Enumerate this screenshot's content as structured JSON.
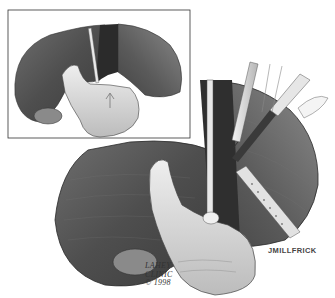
{
  "illustration": {
    "subject": "surgical illustration of liver with hand and instruments",
    "inset_description": "liver lobes split with hand supporting from below, arrow marking direction",
    "colors": {
      "background": "#ffffff",
      "liver_dark": "#5a5a5a",
      "liver_mid": "#7a7a7a",
      "skin": "#d9d9d9",
      "ink": "#222222"
    }
  },
  "credit": {
    "line1": "LAHEY",
    "line2": "CLINIC",
    "line3": "© 1998"
  },
  "signature": "JMILLFRICK"
}
